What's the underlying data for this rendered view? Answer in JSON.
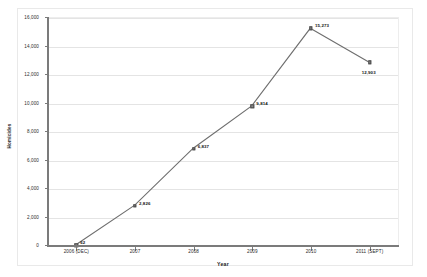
{
  "chart_data": {
    "type": "line",
    "title": "",
    "xlabel": "Year",
    "ylabel": "Homicides",
    "categories": [
      "2006 (DEC)",
      "2007",
      "2008",
      "2009",
      "2010",
      "2011 (SEPT)"
    ],
    "values": [
      62,
      2826,
      6837,
      9814,
      15273,
      12903
    ],
    "point_labels": [
      "62",
      "2,826",
      "6,837",
      "9,814",
      "15,273",
      "12,903"
    ],
    "ylim": [
      0,
      16000
    ],
    "ytick_labels": [
      "16,000",
      "14,000",
      "12,000",
      "10,000",
      "8,000",
      "6,000",
      "4,000",
      "2,000",
      "0"
    ],
    "ytick_values": [
      16000,
      14000,
      12000,
      10000,
      8000,
      6000,
      4000,
      2000,
      0
    ],
    "grid": true,
    "legend": false,
    "series_color": "#6e6e6e",
    "marker_color": "#8a8a8a",
    "gridline_color": "#e4e4e4",
    "axis_color": "#7b7b7b"
  }
}
